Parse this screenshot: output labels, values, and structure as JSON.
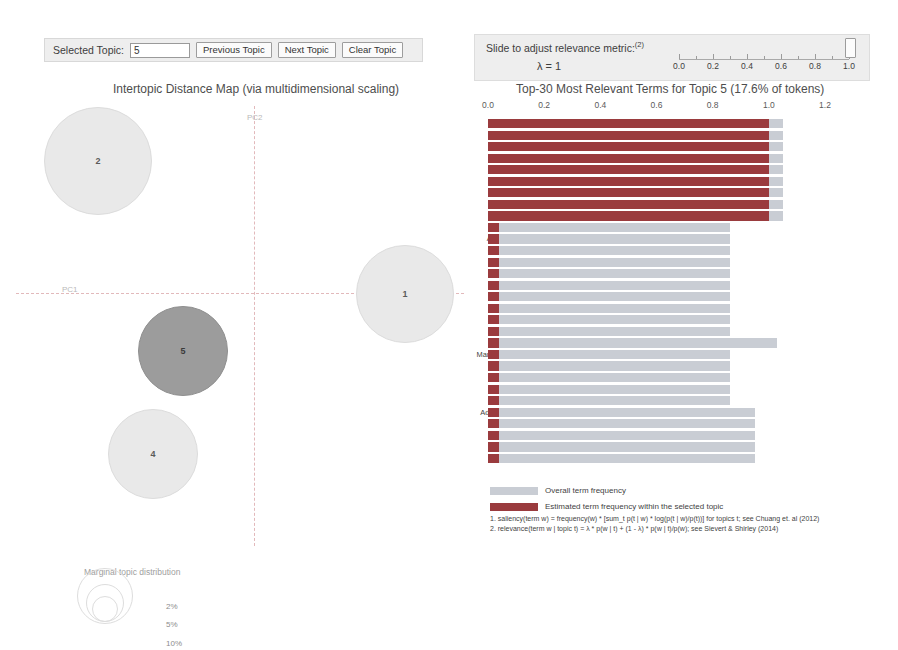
{
  "controls": {
    "selected_topic_label": "Selected Topic:",
    "selected_topic_value": "5",
    "previous_topic": "Previous Topic",
    "next_topic": "Next Topic",
    "clear_topic": "Clear Topic"
  },
  "slider": {
    "label": "Slide to adjust relevance metric:",
    "label_sup": "(2)",
    "lambda_text": "λ = 1",
    "value": 1.0,
    "min": 0.0,
    "max": 1.0,
    "ticks": [
      "0.0",
      "0.2",
      "0.4",
      "0.6",
      "0.8",
      "1.0"
    ]
  },
  "mds": {
    "title": "Intertopic Distance Map (via multidimensional scaling)",
    "xaxis_label": "PC1",
    "yaxis_label": "PC2",
    "legend_title": "Marginal topic distribution",
    "legend_sizes": [
      "2%",
      "5%",
      "10%"
    ],
    "selected_color": "#9c9c9c",
    "default_color": "#e9e9e9",
    "topics": [
      {
        "id": "2",
        "x": 83,
        "y": 60,
        "r": 53,
        "selected": false
      },
      {
        "id": "5",
        "x": 168,
        "y": 250,
        "r": 44,
        "selected": true
      },
      {
        "id": "4",
        "x": 138,
        "y": 353,
        "r": 44,
        "selected": false
      },
      {
        "id": "1",
        "x": 390,
        "y": 193,
        "r": 48,
        "selected": false
      }
    ]
  },
  "chart_data": {
    "type": "bar",
    "title": "Top-30 Most Relevant Terms for Topic 5 (17.6% of tokens)",
    "topic_number": 5,
    "topic_token_pct": "17.6%",
    "xlabel": "",
    "ylabel": "",
    "xlim": [
      0.0,
      1.2
    ],
    "xticks": [
      "0.0",
      "0.2",
      "0.4",
      "0.6",
      "0.8",
      "1.0",
      "1.2"
    ],
    "grid": false,
    "categories": [
      "Approval",
      "Planning",
      "Production",
      "Safety",
      "Scheme",
      "Solution",
      "Supervision",
      "water-quantity",
      "Municipalities",
      "Authorities",
      "Autonomous-regions",
      "Construction-Project",
      "County",
      "Data",
      "decision",
      "Dispatch",
      "Enacted",
      "Flood-control",
      "Flood-defense",
      "Fetchwater",
      "ManagementInstitutions",
      "Quality",
      "Requirements",
      "Reservoir",
      "Water-resources",
      "Administration-License",
      "Construction",
      "Department",
      "Fine",
      "Hearing"
    ],
    "series": [
      {
        "name": "Overall term frequency",
        "color": "#c9cdd4",
        "values": [
          1.05,
          1.05,
          1.05,
          1.05,
          1.05,
          1.05,
          1.05,
          1.05,
          1.05,
          0.86,
          0.86,
          0.86,
          0.86,
          0.86,
          0.86,
          0.86,
          0.86,
          0.86,
          0.86,
          1.03,
          0.86,
          0.86,
          0.86,
          0.86,
          0.86,
          0.95,
          0.95,
          0.95,
          0.95,
          0.95
        ]
      },
      {
        "name": "Estimated term frequency within the selected topic",
        "color": "#9a3b3e",
        "values": [
          1.0,
          1.0,
          1.0,
          1.0,
          1.0,
          1.0,
          1.0,
          1.0,
          1.0,
          0.04,
          0.04,
          0.04,
          0.04,
          0.04,
          0.04,
          0.04,
          0.04,
          0.04,
          0.04,
          0.04,
          0.04,
          0.04,
          0.04,
          0.04,
          0.04,
          0.04,
          0.04,
          0.04,
          0.04,
          0.04
        ]
      }
    ],
    "legend_position": "bottom-left",
    "footnotes": [
      "1. saliency(term w) = frequency(w) * [sum_t p(t | w) * log(p(t | w)/p(t))] for topics t; see Chuang et. al (2012)",
      "2. relevance(term w | topic t) = λ * p(w | t) + (1 - λ) * p(w | t)/p(w); see Sievert & Shirley (2014)"
    ]
  }
}
